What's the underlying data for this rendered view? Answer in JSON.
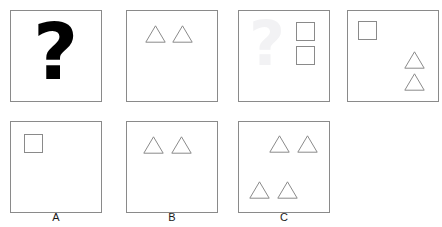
{
  "puzzle": {
    "type": "visual-analogy-matrix",
    "prompt_symbol": "?",
    "ghost_symbol": "?",
    "option_labels": [
      "A",
      "B",
      "C"
    ]
  },
  "problem_row": {
    "name": "problem-sequence",
    "panels": [
      {
        "id": "panel-1",
        "content_kind": "question-mark",
        "shapes": [],
        "square_count": 0,
        "triangle_count": 0
      },
      {
        "id": "panel-2",
        "content_kind": "shapes",
        "square_count": 0,
        "triangle_count": 2,
        "shapes": [
          {
            "kind": "triangle",
            "x": 18,
            "y": 14,
            "w": 21,
            "h": 18
          },
          {
            "kind": "triangle",
            "x": 45,
            "y": 14,
            "w": 21,
            "h": 18
          }
        ]
      },
      {
        "id": "panel-3",
        "content_kind": "shapes",
        "square_count": 2,
        "triangle_count": 0,
        "has_ghost_watermark": true,
        "shapes": [
          {
            "kind": "square",
            "x": 57,
            "y": 11,
            "w": 19,
            "h": 19
          },
          {
            "kind": "square",
            "x": 57,
            "y": 35,
            "w": 19,
            "h": 19
          }
        ]
      },
      {
        "id": "panel-4",
        "content_kind": "shapes",
        "square_count": 1,
        "triangle_count": 2,
        "shapes": [
          {
            "kind": "square",
            "x": 10,
            "y": 10,
            "w": 19,
            "h": 19
          },
          {
            "kind": "triangle",
            "x": 56,
            "y": 40,
            "w": 21,
            "h": 18
          },
          {
            "kind": "triangle",
            "x": 56,
            "y": 62,
            "w": 21,
            "h": 18
          }
        ]
      }
    ]
  },
  "options_row": {
    "name": "answer-options",
    "panels": [
      {
        "id": "option-a",
        "label": "A",
        "square_count": 1,
        "triangle_count": 0,
        "shapes": [
          {
            "kind": "square",
            "x": 13,
            "y": 12,
            "w": 19,
            "h": 19
          }
        ]
      },
      {
        "id": "option-b",
        "label": "B",
        "square_count": 0,
        "triangle_count": 2,
        "shapes": [
          {
            "kind": "triangle",
            "x": 16,
            "y": 14,
            "w": 21,
            "h": 18
          },
          {
            "kind": "triangle",
            "x": 44,
            "y": 14,
            "w": 21,
            "h": 18
          }
        ]
      },
      {
        "id": "option-c",
        "label": "C",
        "square_count": 0,
        "triangle_count": 4,
        "shapes": [
          {
            "kind": "triangle",
            "x": 30,
            "y": 13,
            "w": 21,
            "h": 18
          },
          {
            "kind": "triangle",
            "x": 58,
            "y": 13,
            "w": 21,
            "h": 18
          },
          {
            "kind": "triangle",
            "x": 10,
            "y": 59,
            "w": 21,
            "h": 18
          },
          {
            "kind": "triangle",
            "x": 38,
            "y": 59,
            "w": 21,
            "h": 18
          }
        ]
      }
    ]
  },
  "layout": {
    "panel_size": 92,
    "row1_y": 10,
    "row2_y": 121,
    "row1_x": [
      10,
      126,
      238,
      347
    ],
    "row2_x": [
      10,
      126,
      238
    ],
    "label_y": 211
  },
  "colors": {
    "stroke": "#8a8a8a",
    "ink": "#000000",
    "ghost": "#f2f2f4",
    "background": "#ffffff"
  }
}
